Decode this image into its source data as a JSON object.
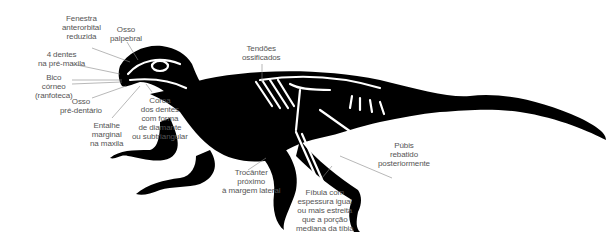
{
  "diagram": {
    "colors": {
      "silhouette": "#000000",
      "bone": "#ffffff",
      "leader_line": "#777777",
      "label_text": "#555555",
      "background": "#ffffff"
    },
    "labels": [
      {
        "id": "fenestra",
        "lines": [
          "Fenestra",
          "anterorbital",
          "reduzida"
        ]
      },
      {
        "id": "osso-palpebral",
        "lines": [
          "Osso",
          "palpebral"
        ]
      },
      {
        "id": "dentes-pre-maxila",
        "lines": [
          "4 dentes",
          "na pré-maxila"
        ]
      },
      {
        "id": "bico-corneo",
        "lines": [
          "Bico",
          "córneo",
          "(ranfoteca)"
        ]
      },
      {
        "id": "osso-pre-dentario",
        "lines": [
          "Osso",
          "pré-dentário"
        ]
      },
      {
        "id": "entalhe-marginal",
        "lines": [
          "Entalhe",
          "marginal",
          "na maxila"
        ]
      },
      {
        "id": "coroa-dentes",
        "lines": [
          "Coroa",
          "dos dentes",
          "com forma",
          "de diamante",
          "ou subtriangular"
        ]
      },
      {
        "id": "tendoes-ossificados",
        "lines": [
          "Tendões",
          "ossificados"
        ]
      },
      {
        "id": "trocanter",
        "lines": [
          "Trocânter",
          "próximo",
          "à margem lateral"
        ]
      },
      {
        "id": "pubis",
        "lines": [
          "Púbis",
          "rebatido",
          "posteriormente"
        ]
      },
      {
        "id": "fibula",
        "lines": [
          "Fíbula com",
          "espessura igual",
          "ou mais estreita",
          "que a porção",
          "mediana da tíbia"
        ]
      }
    ]
  }
}
